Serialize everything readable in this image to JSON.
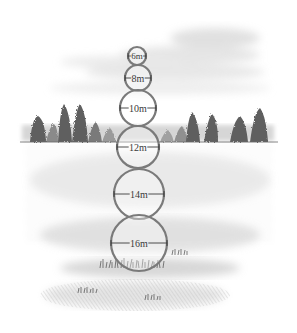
{
  "diagram": {
    "circle_stroke_color": "#7a7a7a",
    "label_color": "#3a3a3a",
    "circles": [
      {
        "label": "6m",
        "cx": 137,
        "cy": 56,
        "r": 9
      },
      {
        "label": "8m",
        "cx": 138,
        "cy": 78,
        "r": 13
      },
      {
        "label": "10m",
        "cx": 138,
        "cy": 108,
        "r": 18
      },
      {
        "label": "12m",
        "cx": 138,
        "cy": 147,
        "r": 21
      },
      {
        "label": "14m",
        "cx": 139,
        "cy": 194,
        "r": 25
      },
      {
        "label": "16m",
        "cx": 139,
        "cy": 243,
        "r": 28
      }
    ]
  }
}
